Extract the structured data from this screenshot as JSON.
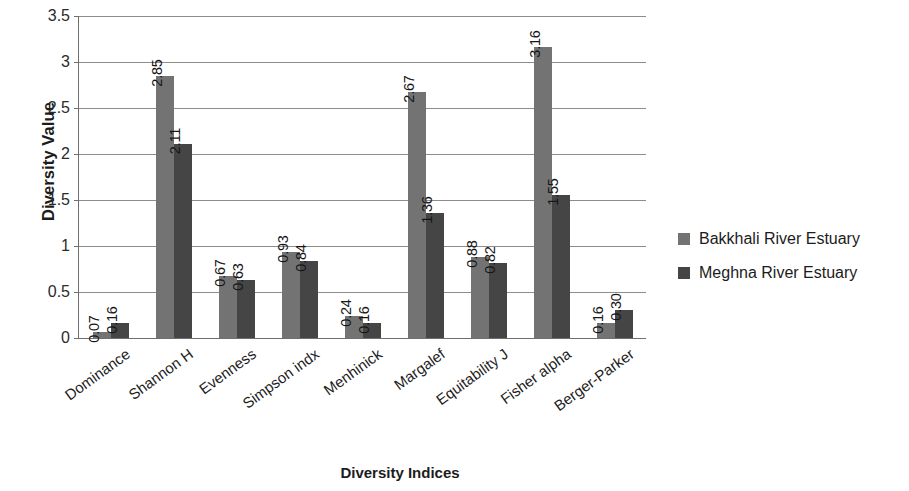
{
  "chart_data": {
    "type": "bar",
    "title": "",
    "xlabel": "Diversity Indices",
    "ylabel": "Diversity Value",
    "ylim": [
      0,
      3.5
    ],
    "ytick_labels": [
      "0",
      "0.5",
      "1",
      "1.5",
      "2",
      "2.5",
      "3",
      "3.5"
    ],
    "ytick_values": [
      0,
      0.5,
      1,
      1.5,
      2,
      2.5,
      3,
      3.5
    ],
    "grid": true,
    "legend_position": "right",
    "categories": [
      "Dominance",
      "Shannon H",
      "Evenness",
      "Simpson indx",
      "Menhinick",
      "Margalef",
      "Equitability J",
      "Fisher alpha",
      "Berger-Parker"
    ],
    "series": [
      {
        "name": "Bakkhali River Estuary",
        "color": "#737373",
        "values": [
          0.07,
          2.85,
          0.67,
          0.93,
          0.24,
          2.67,
          0.88,
          3.16,
          0.16
        ],
        "labels": [
          "0.07",
          "2.85",
          "0.67",
          "0.93",
          "0.24",
          "2.67",
          "0.88",
          "3.16",
          "0.16"
        ]
      },
      {
        "name": "Meghna River Estuary",
        "color": "#454545",
        "values": [
          0.16,
          2.11,
          0.63,
          0.84,
          0.16,
          1.36,
          0.82,
          1.55,
          0.3
        ],
        "labels": [
          "0.16",
          "2.11",
          "0.63",
          "0.84",
          "0.16",
          "1.36",
          "0.82",
          "1.55",
          "0.30"
        ]
      }
    ]
  }
}
